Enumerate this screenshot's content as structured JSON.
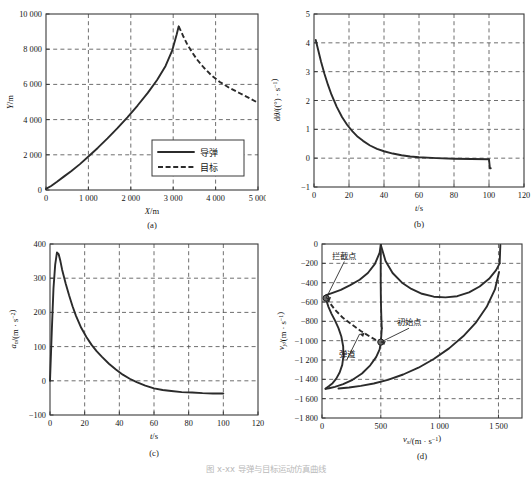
{
  "figure": {
    "caption": "图 x-xx  导弹与目标运动仿真曲线",
    "panel_tags": [
      "(a)",
      "(b)",
      "(c)",
      "(d)"
    ]
  },
  "chart_data": [
    {
      "id": "a",
      "type": "line",
      "title": "",
      "panel_tag": "(a)",
      "xlabel": "X/m",
      "ylabel": "Y/m",
      "xlim": [
        0,
        5000
      ],
      "ylim": [
        0,
        10000
      ],
      "xticks": [
        0,
        1000,
        2000,
        3000,
        4000,
        5000
      ],
      "xticklabels": [
        "0",
        "1 000",
        "2 000",
        "3 000",
        "4 000",
        "5 000"
      ],
      "yticks": [
        0,
        2000,
        4000,
        6000,
        8000,
        10000
      ],
      "yticklabels": [
        "0",
        "2 000",
        "4 000",
        "6 000",
        "8 000",
        "10 000"
      ],
      "grid": true,
      "legend": {
        "position": "lower-right-inset",
        "entries": [
          {
            "label": "导弹",
            "style": "solid"
          },
          {
            "label": "目标",
            "style": "dashed"
          }
        ]
      },
      "series": [
        {
          "name": "导弹",
          "style": "solid",
          "x": [
            0,
            120,
            260,
            420,
            600,
            800,
            1000,
            1220,
            1450,
            1680,
            1920,
            2160,
            2400,
            2620,
            2820,
            2980,
            3080,
            3130
          ],
          "y": [
            60,
            230,
            470,
            760,
            1080,
            1470,
            1900,
            2390,
            2930,
            3500,
            4130,
            4800,
            5520,
            6250,
            7050,
            7950,
            8820,
            9300
          ]
        },
        {
          "name": "目标",
          "style": "dashed",
          "x": [
            3130,
            3180,
            3240,
            3320,
            3430,
            3560,
            3720,
            3900,
            4100,
            4320,
            4560,
            4800,
            5000
          ],
          "y": [
            9300,
            9040,
            8720,
            8330,
            7880,
            7420,
            6960,
            6520,
            6140,
            5810,
            5510,
            5220,
            4950
          ]
        }
      ]
    },
    {
      "id": "b",
      "type": "line",
      "title": "",
      "panel_tag": "(b)",
      "xlabel": "t/s",
      "ylabel": "dθ/((°)·s⁻¹)",
      "xlim": [
        0,
        120
      ],
      "ylim": [
        -1,
        5
      ],
      "xticks": [
        0,
        20,
        40,
        60,
        80,
        100,
        120
      ],
      "xticklabels": [
        "0",
        "20",
        "40",
        "60",
        "80",
        "100",
        "120"
      ],
      "yticks": [
        -1,
        0,
        1,
        2,
        3,
        4,
        5
      ],
      "yticklabels": [
        "-1",
        "0",
        "1",
        "2",
        "3",
        "4",
        "5"
      ],
      "grid": true,
      "series": [
        {
          "name": "dθ/dt",
          "style": "solid",
          "x": [
            1,
            2,
            4,
            6,
            8,
            10,
            13,
            16,
            19,
            22,
            25,
            28,
            32,
            36,
            40,
            45,
            50,
            55,
            60,
            70,
            80,
            90,
            100,
            100.5,
            101
          ],
          "y": [
            4.1,
            3.85,
            3.35,
            2.92,
            2.54,
            2.2,
            1.78,
            1.43,
            1.15,
            0.93,
            0.74,
            0.6,
            0.44,
            0.32,
            0.24,
            0.16,
            0.1,
            0.06,
            0.03,
            0.0,
            -0.02,
            -0.03,
            -0.04,
            -0.35,
            -0.35
          ]
        }
      ]
    },
    {
      "id": "c",
      "type": "line",
      "title": "",
      "panel_tag": "(c)",
      "xlabel": "t/s",
      "ylabel": "a_n/(m·s⁻²)",
      "xlim": [
        0,
        120
      ],
      "ylim": [
        -100,
        400
      ],
      "xticks": [
        0,
        20,
        40,
        60,
        80,
        100,
        120
      ],
      "xticklabels": [
        "0",
        "20",
        "40",
        "60",
        "80",
        "100",
        "120"
      ],
      "yticks": [
        -100,
        0,
        100,
        200,
        300,
        400
      ],
      "yticklabels": [
        "-100",
        "0",
        "100",
        "200",
        "300",
        "400"
      ],
      "grid": true,
      "series": [
        {
          "name": "a_n",
          "style": "solid",
          "x": [
            0,
            1,
            2,
            3,
            4,
            5,
            6,
            7,
            9,
            11,
            13,
            15,
            18,
            21,
            24,
            27,
            30,
            34,
            38,
            42,
            46,
            50,
            55,
            60,
            65,
            70,
            76,
            82,
            88,
            94,
            100
          ],
          "y": [
            0,
            140,
            270,
            340,
            375,
            370,
            350,
            325,
            285,
            250,
            218,
            190,
            155,
            128,
            105,
            86,
            70,
            50,
            33,
            18,
            6,
            -4,
            -14,
            -22,
            -27,
            -30,
            -33,
            -34,
            -36,
            -37,
            -37
          ]
        }
      ]
    },
    {
      "id": "d",
      "type": "line",
      "title": "",
      "panel_tag": "(d)",
      "xlabel": "v_x/(m·s⁻¹)",
      "ylabel": "v_y/(m·s⁻¹)",
      "xlim": [
        0,
        1700
      ],
      "ylim": [
        -1800,
        0
      ],
      "xticks": [
        0,
        500,
        1000,
        1500
      ],
      "xticklabels": [
        "0",
        "500",
        "1 000",
        "1 500"
      ],
      "yticks": [
        -1800,
        -1600,
        -1400,
        -1200,
        -1000,
        -800,
        -600,
        -400,
        -200,
        0
      ],
      "yticklabels": [
        "-1 800",
        "-1 600",
        "-1 400",
        "-1 200",
        "-1 000",
        "-800",
        "-600",
        "-400",
        "-200",
        "0"
      ],
      "grid": true,
      "annotations": [
        {
          "label": "拦截点",
          "text_x": 190,
          "text_y": -150,
          "point_x": 35,
          "point_y": -560
        },
        {
          "label": "初始点",
          "text_x": 740,
          "text_y": -840,
          "point_x": 500,
          "point_y": -1015
        },
        {
          "label": "弹道",
          "text_x": 210,
          "text_y": -1170,
          "point_x": 320,
          "point_y": -930
        }
      ],
      "markers": [
        {
          "name": "拦截点",
          "x": 35,
          "y": -560
        },
        {
          "name": "初始点",
          "x": 500,
          "y": -1015
        }
      ],
      "series": [
        {
          "name": "boundary-upper-left",
          "style": "solid",
          "x": [
            35,
            90,
            160,
            240,
            320,
            390,
            450,
            490,
            500
          ],
          "y": [
            -530,
            -505,
            -475,
            -425,
            -370,
            -300,
            -205,
            -90,
            -10
          ]
        },
        {
          "name": "boundary-upper-right",
          "style": "solid",
          "x": [
            500,
            540,
            600,
            680,
            760,
            850,
            950,
            1050,
            1150,
            1250,
            1340,
            1420,
            1480,
            1510
          ],
          "y": [
            -10,
            -175,
            -300,
            -400,
            -465,
            -515,
            -545,
            -552,
            -540,
            -500,
            -440,
            -360,
            -270,
            -200
          ]
        },
        {
          "name": "boundary-right-rising",
          "style": "solid",
          "x": [
            1510,
            1512,
            1514,
            1516
          ],
          "y": [
            -200,
            -140,
            -70,
            -10
          ]
        },
        {
          "name": "trajectory-dashed",
          "style": "dashed",
          "x": [
            35,
            60,
            110,
            175,
            250,
            330,
            410,
            470,
            500,
            500
          ],
          "y": [
            -560,
            -600,
            -680,
            -760,
            -830,
            -900,
            -960,
            -1000,
            -1015,
            -1015
          ]
        },
        {
          "name": "left-lobe",
          "style": "solid",
          "x": [
            35,
            40,
            55,
            80,
            110,
            140,
            165,
            180,
            182,
            172,
            150,
            120,
            90,
            60,
            40,
            32,
            30
          ],
          "y": [
            -560,
            -595,
            -650,
            -720,
            -790,
            -870,
            -960,
            -1060,
            -1160,
            -1250,
            -1330,
            -1395,
            -1440,
            -1470,
            -1487,
            -1495,
            -1498
          ]
        },
        {
          "name": "lower-curve-to-initial",
          "style": "solid",
          "x": [
            30,
            60,
            110,
            180,
            260,
            340,
            410,
            460,
            490,
            500,
            505,
            508
          ],
          "y": [
            -1498,
            -1492,
            -1478,
            -1450,
            -1405,
            -1340,
            -1255,
            -1170,
            -1090,
            -1015,
            -930,
            -870
          ]
        },
        {
          "name": "lower-right-arc",
          "style": "solid",
          "x": [
            140,
            230,
            330,
            440,
            560,
            690,
            820,
            950,
            1080,
            1200,
            1310,
            1400,
            1470,
            1505
          ],
          "y": [
            -1495,
            -1485,
            -1468,
            -1443,
            -1405,
            -1350,
            -1280,
            -1190,
            -1080,
            -955,
            -810,
            -650,
            -470,
            -290
          ]
        },
        {
          "name": "initial-upward",
          "style": "solid",
          "x": [
            508,
            505,
            502,
            500,
            499,
            499,
            500
          ],
          "y": [
            -870,
            -780,
            -660,
            -520,
            -380,
            -200,
            -10
          ]
        }
      ]
    }
  ]
}
